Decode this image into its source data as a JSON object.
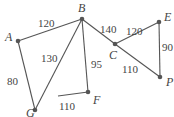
{
  "diagram": {
    "type": "weighted-graph",
    "nodes": [
      {
        "id": "A",
        "x": 18,
        "y": 41,
        "lx": 5,
        "ly": 41
      },
      {
        "id": "B",
        "x": 82,
        "y": 19,
        "lx": 78,
        "ly": 12
      },
      {
        "id": "G",
        "x": 35,
        "y": 110,
        "lx": 26,
        "ly": 117
      },
      {
        "id": "F",
        "x": 88,
        "y": 92,
        "lx": 93,
        "ly": 104
      },
      {
        "id": "C",
        "x": 115,
        "y": 44,
        "lx": 109,
        "ly": 59
      },
      {
        "id": "E",
        "x": 159,
        "y": 22,
        "lx": 164,
        "ly": 21
      },
      {
        "id": "P",
        "x": 160,
        "y": 77,
        "lx": 166,
        "ly": 86
      }
    ],
    "edges": [
      {
        "from": "A",
        "to": "B",
        "weight": "120",
        "lx": 38,
        "ly": 27
      },
      {
        "from": "A",
        "to": "G",
        "weight": "80",
        "lx": 7,
        "ly": 85
      },
      {
        "from": "B",
        "to": "G",
        "weight": "130",
        "lx": 41,
        "ly": 62
      },
      {
        "from": "B",
        "to": "F",
        "weight": "95",
        "lx": 91,
        "ly": 68
      },
      {
        "from": "B",
        "to": "C",
        "weight": "140",
        "lx": 100,
        "ly": 33
      },
      {
        "from": "C",
        "to": "E",
        "weight": "120",
        "lx": 126,
        "ly": 35
      },
      {
        "from": "E",
        "to": "P",
        "weight": "90",
        "lx": 162,
        "ly": 51
      },
      {
        "from": "C",
        "to": "P",
        "weight": "110",
        "lx": 122,
        "ly": 73
      },
      {
        "from": "F",
        "to": "partial",
        "weight": "110",
        "lx": 59,
        "ly": 110
      }
    ]
  }
}
